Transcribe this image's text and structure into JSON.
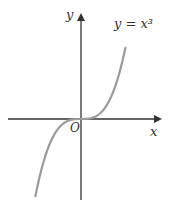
{
  "chart_data": {
    "type": "line",
    "title": "",
    "function": "y = x^3",
    "curve_label": "y = x³",
    "xlabel": "x",
    "ylabel": "y",
    "origin_label": "O",
    "x": [
      -1.5,
      -1.25,
      -1.0,
      -0.75,
      -0.5,
      -0.25,
      0,
      0.25,
      0.5,
      0.75,
      1.0,
      1.25
    ],
    "series": [
      {
        "name": "y = x³",
        "values": [
          -3.375,
          -1.953,
          -1.0,
          -0.422,
          -0.125,
          -0.016,
          0,
          0.016,
          0.125,
          0.422,
          1.0,
          1.953
        ]
      }
    ],
    "grid": false,
    "ticks": false,
    "colors": {
      "axes": "#333333",
      "curve": "#9a9a9a",
      "text": "#333333"
    }
  }
}
